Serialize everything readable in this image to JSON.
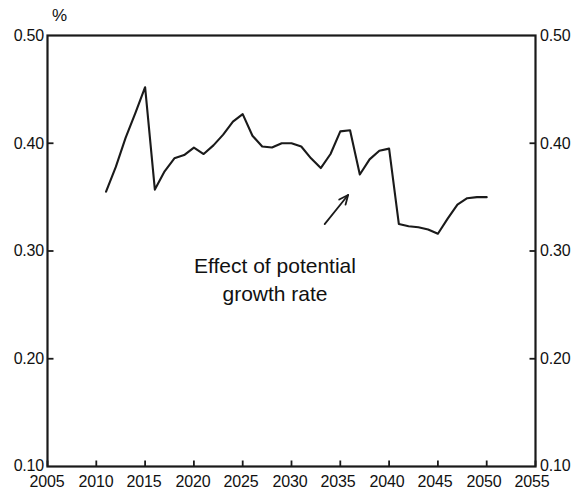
{
  "chart_data": {
    "type": "line",
    "title": "",
    "subtitle": "",
    "unit_label": "%",
    "xlabel": "",
    "ylabel": "",
    "xlim": [
      2005,
      2055
    ],
    "ylim": [
      0.1,
      0.5
    ],
    "grid": false,
    "legend": null,
    "x_ticks": [
      "2005",
      "2010",
      "2015",
      "2020",
      "2025",
      "2030",
      "2035",
      "2040",
      "2045",
      "2050",
      "2055"
    ],
    "y_ticks_left": [
      "0.50",
      "0.40",
      "0.30",
      "0.20",
      "0.10"
    ],
    "y_ticks_right": [
      "0.50",
      "0.40",
      "0.30",
      "0.20",
      "0.10"
    ],
    "line_color": "#1a1a1a",
    "series": [
      {
        "name": "Effect of potential growth rate",
        "x": [
          2011,
          2012,
          2013,
          2014,
          2015,
          2016,
          2017,
          2018,
          2019,
          2020,
          2021,
          2022,
          2023,
          2024,
          2025,
          2026,
          2027,
          2028,
          2029,
          2030,
          2031,
          2032,
          2033,
          2034,
          2035,
          2036,
          2037,
          2038,
          2039,
          2040,
          2041,
          2042,
          2043,
          2044,
          2045,
          2046,
          2047,
          2048,
          2049,
          2050
        ],
        "values": [
          0.355,
          0.378,
          0.405,
          0.428,
          0.452,
          0.357,
          0.374,
          0.386,
          0.389,
          0.396,
          0.39,
          0.398,
          0.408,
          0.42,
          0.427,
          0.407,
          0.397,
          0.396,
          0.4,
          0.4,
          0.397,
          0.386,
          0.377,
          0.39,
          0.411,
          0.412,
          0.371,
          0.385,
          0.393,
          0.395,
          0.325,
          0.323,
          0.322,
          0.32,
          0.316,
          0.33,
          0.343,
          0.349,
          0.35,
          0.35
        ]
      }
    ],
    "annotations": [
      {
        "name": "potential-growth-rate-callout",
        "text_line_1": "Effect of potential",
        "text_line_2": "growth rate",
        "arrow": {
          "from_x": 2033.4,
          "from_y": 0.325,
          "to_x": 2035.8,
          "to_y": 0.352
        }
      }
    ]
  }
}
